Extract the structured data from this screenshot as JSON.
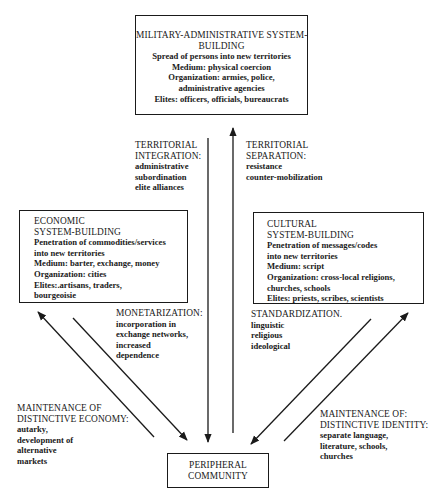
{
  "diagram": {
    "nodes": {
      "military": {
        "title": [
          "MILITARY-ADMINISTRATIVE SYSTEM-",
          "BUILDING"
        ],
        "lines": [
          "Spread of persons into new territories",
          "Medium: physical coercion",
          "Organization: armies, police,",
          "administrative agencies",
          "Elites: officers, officials, bureaucrats"
        ]
      },
      "economic": {
        "title": [
          "ECONOMIC",
          "SYSTEM-BUILDING"
        ],
        "lines": [
          "Penetration of commodities/services",
          "into new territories",
          "Medium: barter, exchange, money",
          "Organization: cities",
          "Elites:.artisans, traders,",
          "bourgeoisie"
        ]
      },
      "cultural": {
        "title": [
          "CULTURAL",
          "SYSTEM-BUILDING"
        ],
        "lines": [
          "Penetration of messages/codes",
          "into new territories",
          "Medium: script",
          "Organization: cross-local religions,",
          "churches, schools",
          "Elites: priests, scribes, scientists"
        ]
      },
      "peripheral": {
        "title": [
          "PERIPHERAL",
          "COMMUNITY"
        ]
      }
    },
    "edges": {
      "territorial_integration": {
        "title": [
          "TERRITORIAL",
          "INTEGRATION:"
        ],
        "lines": [
          "administrative",
          "subordination",
          "elite alliances"
        ],
        "direction": "military -> peripheral"
      },
      "territorial_separation": {
        "title": [
          "TERRITORIAL",
          "SEPARATION:"
        ],
        "lines": [
          "resistance",
          "counter-mobilization"
        ],
        "direction": "peripheral -> military"
      },
      "monetarization": {
        "title": [
          "MONETARIZATION:"
        ],
        "lines": [
          "incorporation in",
          "exchange networks,",
          "increased",
          "dependence"
        ],
        "direction": "economic -> peripheral"
      },
      "standardization": {
        "title": [
          "STANDARDIZATION."
        ],
        "lines": [
          "linguistic",
          "religious",
          "ideological"
        ],
        "direction": "cultural -> peripheral"
      },
      "maintenance_economy": {
        "title": [
          "MAINTENANCE OF",
          "DISTINCTIVE ECONOMY:"
        ],
        "lines": [
          "autarky,",
          "development of",
          "alternative",
          "markets"
        ],
        "direction": "peripheral -> economic"
      },
      "maintenance_identity": {
        "title": [
          "MAINTENANCE OF:",
          "DISTINCTIVE IDENTITY:"
        ],
        "lines": [
          "separate language,",
          "literature, schools,",
          "churches"
        ],
        "direction": "peripheral -> cultural"
      }
    },
    "colors": {
      "ink": "#1a1a1a",
      "background": "#ffffff"
    }
  }
}
